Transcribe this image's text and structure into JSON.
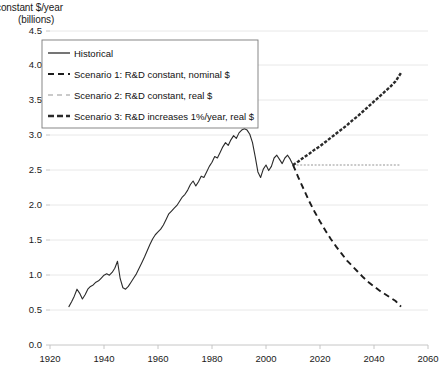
{
  "chart_data": {
    "type": "line",
    "title": "constant  $/year",
    "subtitle": "(billions)",
    "ylabel": "constant $/year (billions)",
    "xlabel": "",
    "grid": true,
    "legend_position": "top-left",
    "xlim": [
      1920,
      2060
    ],
    "ylim": [
      0.0,
      4.5
    ],
    "xticks": [
      "1920",
      "1940",
      "1960",
      "1980",
      "2000",
      "2020",
      "2040",
      "2060"
    ],
    "yticks": [
      "0.0",
      "0.5",
      "1.0",
      "1.5",
      "2.0",
      "2.5",
      "3.0",
      "3.5",
      "4.0",
      "4.5"
    ],
    "series": [
      {
        "name": "Historical",
        "style": "solid",
        "color": "#2b2b2b",
        "x": [
          1927,
          1928,
          1929,
          1930,
          1931,
          1932,
          1933,
          1934,
          1935,
          1936,
          1937,
          1938,
          1939,
          1940,
          1941,
          1942,
          1943,
          1944,
          1945,
          1946,
          1947,
          1948,
          1949,
          1950,
          1951,
          1952,
          1953,
          1954,
          1955,
          1956,
          1957,
          1958,
          1959,
          1960,
          1961,
          1962,
          1963,
          1964,
          1965,
          1966,
          1967,
          1968,
          1969,
          1970,
          1971,
          1972,
          1973,
          1974,
          1975,
          1976,
          1977,
          1978,
          1979,
          1980,
          1981,
          1982,
          1983,
          1984,
          1985,
          1986,
          1987,
          1988,
          1989,
          1990,
          1991,
          1992,
          1993,
          1994,
          1995,
          1996,
          1997,
          1998,
          1999,
          2000,
          2001,
          2002,
          2003,
          2004,
          2005,
          2006,
          2007,
          2008,
          2009,
          2010
        ],
        "values": [
          0.55,
          0.62,
          0.7,
          0.8,
          0.74,
          0.66,
          0.72,
          0.8,
          0.84,
          0.86,
          0.9,
          0.92,
          0.96,
          1.0,
          1.02,
          1.0,
          1.04,
          1.1,
          1.2,
          0.95,
          0.82,
          0.8,
          0.84,
          0.9,
          0.96,
          1.02,
          1.1,
          1.18,
          1.26,
          1.35,
          1.44,
          1.52,
          1.58,
          1.62,
          1.66,
          1.72,
          1.8,
          1.88,
          1.92,
          1.96,
          2.0,
          2.06,
          2.12,
          2.16,
          2.22,
          2.3,
          2.35,
          2.28,
          2.34,
          2.42,
          2.4,
          2.48,
          2.56,
          2.62,
          2.7,
          2.68,
          2.76,
          2.84,
          2.9,
          2.86,
          2.94,
          3.0,
          2.96,
          3.04,
          3.08,
          3.1,
          3.08,
          3.02,
          2.9,
          2.7,
          2.48,
          2.4,
          2.52,
          2.58,
          2.5,
          2.56,
          2.68,
          2.72,
          2.66,
          2.6,
          2.68,
          2.72,
          2.66,
          2.58
        ]
      },
      {
        "name": "Scenario 1: R&D constant, nominal $",
        "style": "dashed",
        "color": "#1c1c1c",
        "x": [
          2010,
          2012,
          2014,
          2016,
          2018,
          2020,
          2022,
          2024,
          2026,
          2028,
          2030,
          2032,
          2034,
          2036,
          2038,
          2040,
          2042,
          2044,
          2046,
          2048,
          2050
        ],
        "values": [
          2.58,
          2.4,
          2.23,
          2.06,
          1.91,
          1.77,
          1.64,
          1.52,
          1.41,
          1.31,
          1.21,
          1.13,
          1.05,
          0.97,
          0.9,
          0.84,
          0.78,
          0.73,
          0.68,
          0.63,
          0.55
        ]
      },
      {
        "name": "Scenario 2: R&D constant, real $",
        "style": "dotted",
        "color": "#b9b9b9",
        "x": [
          2010,
          2050
        ],
        "values": [
          2.58,
          2.58
        ]
      },
      {
        "name": "Scenario 3: R&D increases 1%/year, real $",
        "style": "dash-dot",
        "color": "#2a2a2a",
        "x": [
          2010,
          2012,
          2014,
          2016,
          2018,
          2020,
          2022,
          2024,
          2026,
          2028,
          2030,
          2032,
          2034,
          2036,
          2038,
          2040,
          2042,
          2044,
          2046,
          2048,
          2050
        ],
        "values": [
          2.58,
          2.63,
          2.69,
          2.74,
          2.8,
          2.85,
          2.91,
          2.97,
          3.03,
          3.09,
          3.15,
          3.22,
          3.28,
          3.35,
          3.42,
          3.49,
          3.56,
          3.63,
          3.7,
          3.78,
          3.9
        ]
      }
    ]
  },
  "legend": {
    "items": [
      {
        "label": "Historical"
      },
      {
        "label": "Scenario 1: R&D constant, nominal $"
      },
      {
        "label": "Scenario 2: R&D constant, real $"
      },
      {
        "label": "Scenario 3: R&D increases 1%/year, real $"
      }
    ]
  }
}
